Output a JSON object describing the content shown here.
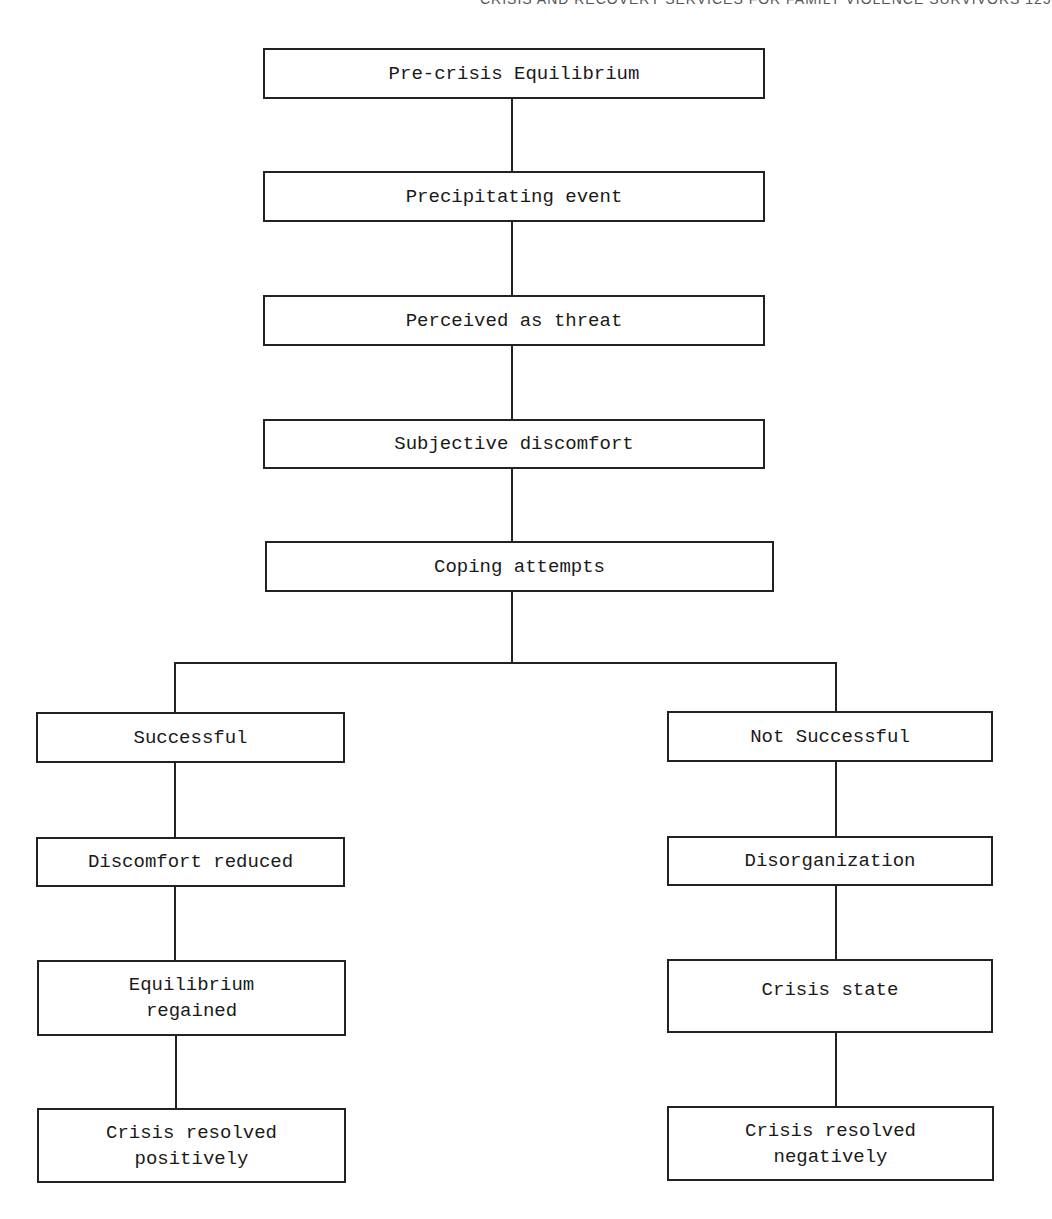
{
  "page": {
    "running_header": "CRISIS AND RECOVERY SERVICES FOR FAMILY VIOLENCE SURVIVORS    125"
  },
  "flowchart": {
    "main_sequence": [
      "Pre-crisis Equilibrium",
      "Precipitating event",
      "Perceived as threat",
      "Subjective discomfort",
      "Coping attempts"
    ],
    "left_branch": [
      "Successful",
      "Discomfort reduced",
      "Equilibrium\nregained",
      "Crisis resolved\npositively"
    ],
    "right_branch": [
      "Not Successful",
      "Disorganization",
      "Crisis state",
      "Crisis resolved\nnegatively"
    ],
    "colors": {
      "line": "#222222",
      "box_fill": "#ffffff",
      "text": "#1a1a1a"
    }
  }
}
